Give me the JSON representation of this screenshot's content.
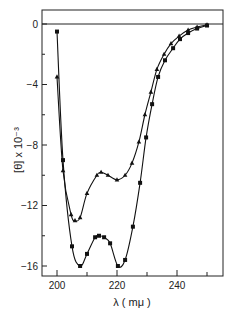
{
  "chart_data": {
    "type": "line",
    "title": "",
    "xlabel": "λ ( mμ )",
    "ylabel": "[θ] x 10⁻³",
    "xlim": [
      200,
      250
    ],
    "ylim": [
      -16.5,
      0.5
    ],
    "x_ticks": [
      200,
      220,
      240
    ],
    "y_ticks": [
      0,
      -4,
      -8,
      -12,
      -16
    ],
    "grid": false,
    "legend": null,
    "series": [
      {
        "name": "squares",
        "marker": "square",
        "points": [
          [
            200,
            -0.5
          ],
          [
            202,
            -9.0
          ],
          [
            205,
            -14.7
          ],
          [
            207.7,
            -16.0
          ],
          [
            210,
            -15.2
          ],
          [
            212.7,
            -14.1
          ],
          [
            214,
            -14.0
          ],
          [
            215.7,
            -14.1
          ],
          [
            217.7,
            -14.5
          ],
          [
            220.3,
            -16.0
          ],
          [
            222.7,
            -15.6
          ],
          [
            225.3,
            -13.4
          ],
          [
            227.7,
            -10.5
          ],
          [
            229.7,
            -7.5
          ],
          [
            231.7,
            -5.3
          ],
          [
            233.7,
            -3.5
          ],
          [
            236,
            -2.4
          ],
          [
            238.7,
            -1.6
          ],
          [
            241,
            -1.0
          ],
          [
            243.7,
            -0.6
          ],
          [
            246.7,
            -0.3
          ],
          [
            250,
            -0.1
          ]
        ]
      },
      {
        "name": "triangles",
        "marker": "triangle",
        "points": [
          [
            200,
            -3.5
          ],
          [
            202,
            -9.7
          ],
          [
            204.7,
            -12.6
          ],
          [
            206,
            -13.0
          ],
          [
            207.7,
            -12.8
          ],
          [
            210,
            -11.2
          ],
          [
            213.3,
            -10.0
          ],
          [
            214.7,
            -9.8
          ],
          [
            217,
            -10.0
          ],
          [
            220,
            -10.3
          ],
          [
            222.7,
            -10.0
          ],
          [
            225,
            -9.2
          ],
          [
            227.3,
            -7.8
          ],
          [
            229.3,
            -6.0
          ],
          [
            231.3,
            -4.5
          ],
          [
            233.3,
            -3.0
          ],
          [
            235.7,
            -2.0
          ],
          [
            238,
            -1.3
          ],
          [
            240.7,
            -0.8
          ],
          [
            243.7,
            -0.4
          ],
          [
            246.7,
            -0.2
          ],
          [
            250,
            -0.05
          ]
        ]
      }
    ]
  }
}
